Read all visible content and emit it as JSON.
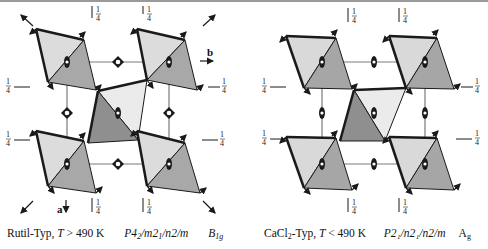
{
  "figure": {
    "colors": {
      "light_face": "#d9d9d9",
      "dark_face": "#a6a6a6",
      "center_light": "#e6e6e6",
      "center_dark": "#8f8f8f",
      "edge": "#1a1a1a",
      "cell_line": "#7a7a7a",
      "top_bar": "#9a9a9a"
    },
    "height_label": "1/4",
    "height_num": "1",
    "height_den": "4"
  },
  "left_panel": {
    "title": "Rutil-Typ",
    "axis_a": "a",
    "axis_b": "b",
    "caption": {
      "structure": "Rutil-Typ, ",
      "temp_var": "T",
      "temp_rel": " > 490 K",
      "space_group_parts": [
        "P",
        "4",
        "2",
        "/m",
        "2",
        "1",
        "/n",
        "2",
        "/m"
      ],
      "space_group": "P4₂/m2₁/n2/m",
      "irrep_main": "B",
      "irrep_sub": "1g"
    },
    "symmetry_symbol_center": "4₂ screw axis (diamond)",
    "symmetry_symbol_corner": "2-fold axis (ellipse)"
  },
  "right_panel": {
    "title": "CaCl2-Typ",
    "caption": {
      "structure_main": "CaCl",
      "structure_sub": "2",
      "structure_rest": "-Typ, ",
      "temp_var": "T",
      "temp_rel": " < 490 K",
      "space_group": "P2₁/n2₁/n2/m",
      "irrep_main": "A",
      "irrep_sub": "g"
    },
    "symmetry_symbol": "2-fold axis (ellipse)"
  }
}
